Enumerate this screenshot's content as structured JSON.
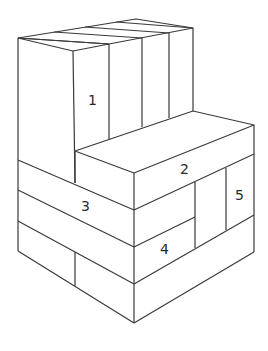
{
  "diagram": {
    "type": "isometric block stack",
    "stroke_color": "#3a3a3a",
    "background": "#ffffff",
    "labels": [
      {
        "id": "1",
        "text": "1",
        "x": 88,
        "y": 93
      },
      {
        "id": "2",
        "text": "2",
        "x": 180,
        "y": 162
      },
      {
        "id": "3",
        "text": "3",
        "x": 81,
        "y": 199
      },
      {
        "id": "4",
        "text": "4",
        "x": 160,
        "y": 242
      },
      {
        "id": "5",
        "text": "5",
        "x": 235,
        "y": 188
      }
    ]
  }
}
